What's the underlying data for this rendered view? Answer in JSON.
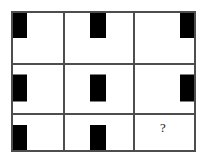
{
  "puzzle": {
    "type": "matrix-reasoning",
    "title": "Progressive Matrix",
    "rows": 3,
    "columns": 3,
    "bar_color": "#000000",
    "grid_line_color": "#4d4d4d",
    "background_color": "#ffffff",
    "missing_cell_marker": "?",
    "rule_horizontal": "column sets horizontal position: left, center, right",
    "rule_vertical": "row sets vertical position: top, middle, bottom",
    "cells": [
      {
        "id": "cell-r1c1",
        "row": 1,
        "column": 1,
        "content": "bar",
        "h": "left",
        "v": "top",
        "label": "black bar top-left"
      },
      {
        "id": "cell-r1c2",
        "row": 1,
        "column": 2,
        "content": "bar",
        "h": "center",
        "v": "top",
        "label": "black bar top-center"
      },
      {
        "id": "cell-r1c3",
        "row": 1,
        "column": 3,
        "content": "bar",
        "h": "right",
        "v": "top",
        "label": "black bar top-right"
      },
      {
        "id": "cell-r2c1",
        "row": 2,
        "column": 1,
        "content": "bar",
        "h": "left",
        "v": "middle",
        "label": "black bar middle-left"
      },
      {
        "id": "cell-r2c2",
        "row": 2,
        "column": 2,
        "content": "bar",
        "h": "center",
        "v": "middle",
        "label": "black bar middle-center"
      },
      {
        "id": "cell-r2c3",
        "row": 2,
        "column": 3,
        "content": "bar",
        "h": "right",
        "v": "middle",
        "label": "black bar middle-right"
      },
      {
        "id": "cell-r3c1",
        "row": 3,
        "column": 1,
        "content": "bar",
        "h": "left",
        "v": "bottom",
        "label": "black bar bottom-left"
      },
      {
        "id": "cell-r3c2",
        "row": 3,
        "column": 2,
        "content": "bar",
        "h": "center",
        "v": "bottom",
        "label": "black bar bottom-center"
      },
      {
        "id": "cell-r3c3",
        "row": 3,
        "column": 3,
        "content": "question",
        "h": "",
        "v": "",
        "label": "missing cell with question mark"
      }
    ]
  }
}
